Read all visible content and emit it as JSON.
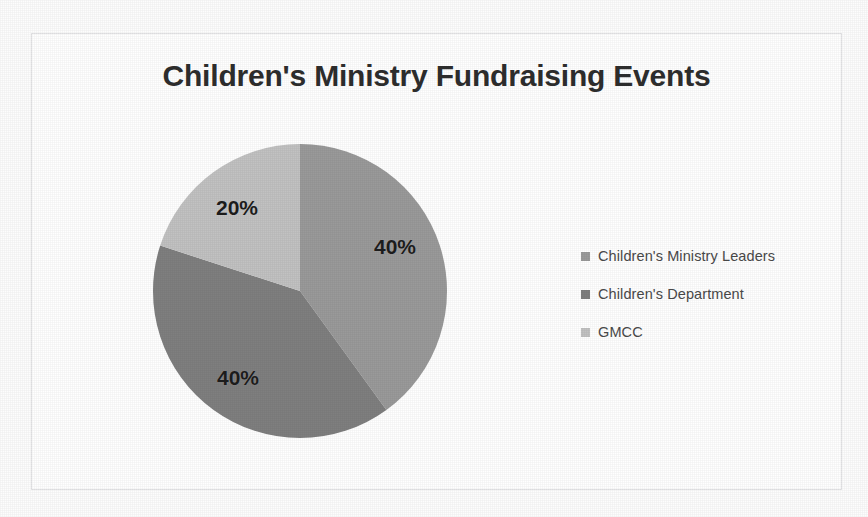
{
  "document": {
    "background_color": "#fdfdfd",
    "frame_color": "#e3e3e5"
  },
  "chart_data": {
    "type": "pie",
    "title": "Children's Ministry Fundraising Events",
    "xlabel": "",
    "ylabel": "",
    "legend_position": "right",
    "grid": false,
    "start_angle_deg": 0,
    "direction": "clockwise",
    "categories": [
      "Children's Ministry Leaders",
      "Children's Department",
      "GMCC"
    ],
    "values": [
      40,
      40,
      20
    ],
    "data_labels": [
      "40%",
      "40%",
      "20%"
    ],
    "colors": [
      "#9a9a9a",
      "#7f7f7f",
      "#c2c2c2"
    ],
    "slices": [
      {
        "label": "Children's Ministry Leaders",
        "value": 40,
        "data_label": "40%",
        "color": "#9a9a9a",
        "start_deg": 0,
        "sweep_deg": 144
      },
      {
        "label": "Children's Department",
        "value": 40,
        "data_label": "40%",
        "color": "#7f7f7f",
        "start_deg": 144,
        "sweep_deg": 144
      },
      {
        "label": "GMCC",
        "value": 20,
        "data_label": "20%",
        "color": "#c2c2c2",
        "start_deg": 288,
        "sweep_deg": 72
      }
    ]
  },
  "legend": {
    "items": [
      {
        "label": "Children's Ministry Leaders",
        "color": "#9a9a9a"
      },
      {
        "label": "Children's Department",
        "color": "#7f7f7f"
      },
      {
        "label": "GMCC",
        "color": "#c2c2c2"
      }
    ]
  }
}
